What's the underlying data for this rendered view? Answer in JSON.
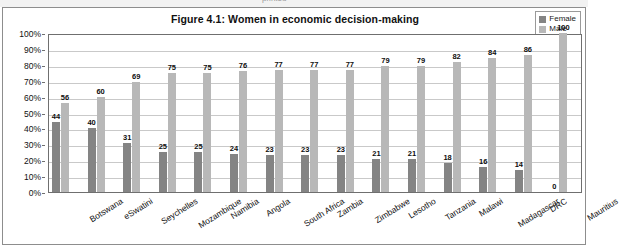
{
  "top_partial_text": "printed",
  "chart": {
    "title": "Figure 4.1: Women in economic decision-making",
    "legend": [
      {
        "label": "Female",
        "color": "#848484"
      },
      {
        "label": "Male",
        "color": "#b8b8b8"
      }
    ],
    "y_ticks": [
      "100%",
      "90%",
      "80%",
      "70%",
      "60%",
      "50%",
      "40%",
      "30%",
      "20%",
      "10%",
      "0%"
    ]
  },
  "chart_data": {
    "type": "bar",
    "title": "Figure 4.1: Women in economic decision-making",
    "xlabel": "",
    "ylabel": "",
    "ylim": [
      0,
      100
    ],
    "ytick_values": [
      0,
      10,
      20,
      30,
      40,
      50,
      60,
      70,
      80,
      90,
      100
    ],
    "ytick_labels": [
      "0%",
      "10%",
      "20%",
      "30%",
      "40%",
      "50%",
      "60%",
      "70%",
      "80%",
      "90%",
      "100%"
    ],
    "grid": true,
    "legend_position": "top-right",
    "categories": [
      "Botswana",
      "eSwatini",
      "Seychelles",
      "Mozambique",
      "Namibia",
      "Angola",
      "South Africa",
      "Zambia",
      "Zimbabwe",
      "Lesotho",
      "Tanzania",
      "Malawi",
      "Madagascar",
      "DRC",
      "Mauritius"
    ],
    "series": [
      {
        "name": "Female",
        "color": "#848484",
        "values": [
          44,
          40,
          31,
          25,
          25,
          24,
          23,
          23,
          23,
          21,
          21,
          18,
          16,
          14,
          0
        ]
      },
      {
        "name": "Male",
        "color": "#b8b8b8",
        "values": [
          56,
          60,
          69,
          75,
          75,
          76,
          77,
          77,
          77,
          79,
          79,
          82,
          84,
          86,
          100
        ]
      }
    ]
  }
}
